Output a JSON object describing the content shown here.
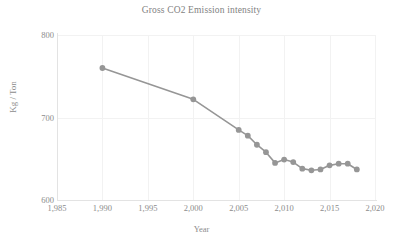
{
  "chart_data": {
    "type": "line",
    "title": "Gross CO2 Emission intensity",
    "xlabel": "Year",
    "ylabel": "Kg / Ton",
    "xlim": [
      1985,
      2020
    ],
    "ylim": [
      600,
      800
    ],
    "grid": true,
    "legend": false,
    "series_color": "#969696",
    "marker": "circle",
    "x_tick_labels": [
      "1,985",
      "1,990",
      "1,995",
      "2,000",
      "2,005",
      "2,010",
      "2,015",
      "2,020"
    ],
    "x_tick_values": [
      1985,
      1990,
      1995,
      2000,
      2005,
      2010,
      2015,
      2020
    ],
    "y_tick_labels": [
      "800",
      "700",
      "600"
    ],
    "y_tick_values": [
      800,
      700,
      600
    ],
    "series": [
      {
        "name": "Gross CO2 Emission intensity",
        "x": [
          1990,
          2000,
          2005,
          2006,
          2007,
          2008,
          2009,
          2010,
          2011,
          2012,
          2013,
          2014,
          2015,
          2016,
          2017,
          2018
        ],
        "values": [
          760,
          722,
          685,
          678,
          667,
          658,
          645,
          649,
          646,
          638,
          636,
          637,
          642,
          644,
          644,
          637
        ]
      }
    ]
  }
}
